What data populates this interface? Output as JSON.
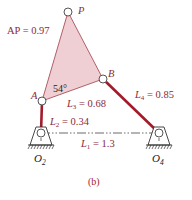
{
  "figure": {
    "caption": "(b)",
    "colors": {
      "link": "#a31b2a",
      "coupler_fill": "#efcfd3",
      "coupler_stroke": "#b0606a",
      "label": "#8b2a3a",
      "ground": "#333333"
    },
    "points": {
      "P": {
        "name": "P",
        "x": 68,
        "y": 12
      },
      "A": {
        "name": "A",
        "x": 42,
        "y": 101
      },
      "B": {
        "name": "B",
        "x": 103,
        "y": 79
      },
      "O2": {
        "name": "O",
        "sub": "2",
        "x": 41,
        "y": 133
      },
      "O4": {
        "name": "O",
        "sub": "4",
        "x": 159,
        "y": 133
      }
    },
    "labels": {
      "ap": "AP = 0.97",
      "angle": "54°",
      "l1_sym": "L",
      "l1_sub": "1",
      "l1_val": " = 1.3",
      "l2_sym": "L",
      "l2_sub": "2",
      "l2_val": " = 0.34",
      "l3_sym": "L",
      "l3_sub": "3",
      "l3_val": " = 0.68",
      "l4_sym": "L",
      "l4_sub": "4",
      "l4_val": " = 0.85",
      "p": "P",
      "a": "A",
      "b": "B",
      "o2": "O",
      "o2_sub": "2",
      "o4": "O",
      "o4_sub": "4"
    }
  }
}
